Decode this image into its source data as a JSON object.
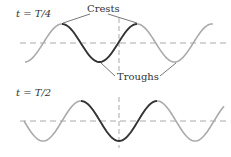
{
  "panels": [
    {
      "time_label_t": "t",
      "time_label_eq": " = ",
      "time_label_value": "T/4",
      "annotations": {
        "crests": "Crests",
        "troughs": "Troughs"
      }
    },
    {
      "time_label_t": "t",
      "time_label_eq": " = ",
      "time_label_value": "T/2"
    }
  ],
  "colors": {
    "wave_light": "#aaaaaa",
    "wave_dark": "#333333",
    "axis_dashed": "#aaaaaa",
    "pointer_line": "#555555"
  }
}
